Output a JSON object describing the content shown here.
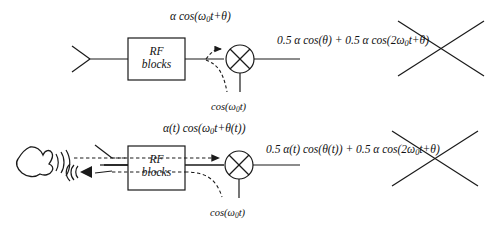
{
  "figure": {
    "background_color": "#ffffff",
    "line_color": "#1a1a1a"
  },
  "rows": [
    {
      "id": "static-case",
      "antenna_label": "antenna",
      "rf_block": {
        "line1": "RF",
        "line2": "blocks"
      },
      "input_formula": {
        "pre": "α cos(ω",
        "sub": "0",
        "post": "t+θ)"
      },
      "lo_formula": {
        "pre": "cos(ω",
        "sub": "0",
        "post": "t)"
      },
      "output_formula": {
        "kept": "0.5 α cos(θ) + 0.5 α cos(",
        "struck_pre": "2ω",
        "struck_sub": "0",
        "struck_post": "t+θ)"
      },
      "crossed_out": true
    },
    {
      "id": "time-varying-case",
      "source_label": "hand-scatterer",
      "antenna_label": "antenna",
      "rf_block": {
        "line1": "RF",
        "line2": "blocks"
      },
      "input_formula": {
        "pre": "α(t) cos(ω",
        "sub": "0",
        "post": "t+θ(t))"
      },
      "lo_formula": {
        "pre": "cos(ω",
        "sub": "0",
        "post": "t)"
      },
      "output_formula": {
        "kept": "0.5 α(t) cos(θ(t)) + 0.5 α cos(",
        "struck_pre": "2ω",
        "struck_sub": "0",
        "struck_post": "t+θ)"
      },
      "crossed_out": true
    }
  ],
  "icons": {
    "antenna": "antenna-icon",
    "mixer": "mixer-icon",
    "hand": "hand-icon",
    "waves_out": "radio-wave-out-icon",
    "waves_back": "radio-wave-reflect-icon",
    "arrow": "arrow-icon",
    "cross_out": "cross-out-icon"
  }
}
